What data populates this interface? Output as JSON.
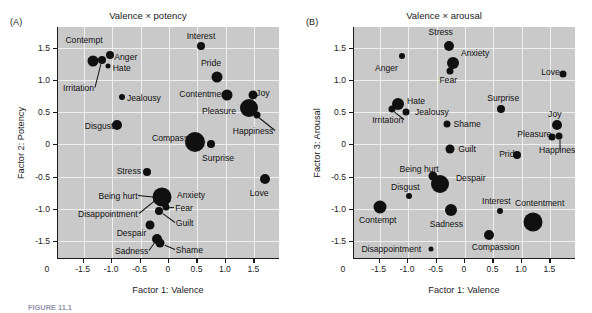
{
  "figure": {
    "caption": "FIGURE 11.1",
    "panels": [
      {
        "letter": "(A)",
        "title": "Valence × potency",
        "xlabel": "Factor 1: Valence",
        "ylabel": "Factor 2: Potency"
      },
      {
        "letter": "(B)",
        "title": "Valence × arousal",
        "xlabel": "Factor 1: Valence",
        "ylabel": "Factor 3: Arousal"
      }
    ]
  },
  "chart_data": [
    {
      "type": "scatter",
      "title": "Valence × potency",
      "xlabel": "Factor 1: Valence",
      "ylabel": "Factor 2: Potency",
      "xlim": [
        -1.95,
        1.95
      ],
      "ylim": [
        -1.78,
        1.82
      ],
      "xticks": [
        -1.5,
        -1.0,
        -0.5,
        0,
        0.5,
        1.0,
        1.5
      ],
      "xticklabels": [
        "-1.5",
        "-1.0",
        "-0.5",
        "0",
        "0.5",
        "1.0",
        "1.5"
      ],
      "yticks": [
        -1.5,
        -1.0,
        -0.5,
        0,
        0.5,
        1.0,
        1.5
      ],
      "yticklabels": [
        "-1.5",
        "-1.0",
        "-0.5",
        "0",
        "0.5",
        "1.0",
        "1.5"
      ],
      "origin_label": "0",
      "grid": true,
      "marker_color": "#101010",
      "points": [
        {
          "label": "Contempt",
          "x": -1.33,
          "y": 1.29,
          "size": 11,
          "lx": -1.82,
          "ly": 1.62,
          "anchor": "left",
          "leader": false
        },
        {
          "label": "Irritation",
          "x": -1.18,
          "y": 1.31,
          "size": 8,
          "lx": -1.86,
          "ly": 0.88,
          "anchor": "left",
          "leader": true
        },
        {
          "label": "Anger",
          "x": -1.04,
          "y": 1.39,
          "size": 8,
          "lx": -0.96,
          "ly": 1.36,
          "anchor": "left",
          "leader": false
        },
        {
          "label": "Hate",
          "x": -1.07,
          "y": 1.21,
          "size": 5,
          "lx": -0.99,
          "ly": 1.18,
          "anchor": "left",
          "leader": false
        },
        {
          "label": "Jealousy",
          "x": -0.82,
          "y": 0.73,
          "size": 6,
          "lx": -0.74,
          "ly": 0.72,
          "anchor": "left",
          "leader": false
        },
        {
          "label": "Disgust",
          "x": -0.92,
          "y": 0.3,
          "size": 10,
          "lx": -1.48,
          "ly": 0.28,
          "anchor": "left",
          "leader": false
        },
        {
          "label": "Compassion",
          "x": 0.45,
          "y": 0.03,
          "size": 20,
          "lx": -0.3,
          "ly": 0.09,
          "anchor": "left",
          "leader": false
        },
        {
          "label": "Surprise",
          "x": 0.74,
          "y": 0.01,
          "size": 8,
          "lx": 0.58,
          "ly": -0.22,
          "anchor": "left",
          "leader": false
        },
        {
          "label": "Interest",
          "x": 0.56,
          "y": 1.53,
          "size": 8,
          "lx": 0.31,
          "ly": 1.68,
          "anchor": "left",
          "leader": false
        },
        {
          "label": "Pride",
          "x": 0.85,
          "y": 1.05,
          "size": 11,
          "lx": 0.56,
          "ly": 1.26,
          "anchor": "left",
          "leader": false
        },
        {
          "label": "Contentment",
          "x": 1.02,
          "y": 0.76,
          "size": 11,
          "lx": 0.18,
          "ly": 0.78,
          "anchor": "left",
          "leader": false
        },
        {
          "label": "Pleasure",
          "x": 1.4,
          "y": 0.57,
          "size": 18,
          "lx": 0.58,
          "ly": 0.52,
          "anchor": "left",
          "leader": false
        },
        {
          "label": "Joy",
          "x": 1.48,
          "y": 0.77,
          "size": 9,
          "lx": 1.53,
          "ly": 0.8,
          "anchor": "left",
          "leader": false
        },
        {
          "label": "Happiness",
          "x": 1.54,
          "y": 0.45,
          "size": 7,
          "lx": 1.12,
          "ly": 0.21,
          "anchor": "left",
          "leader": true
        },
        {
          "label": "Love",
          "x": 1.68,
          "y": -0.54,
          "size": 10,
          "lx": 1.42,
          "ly": -0.76,
          "anchor": "left",
          "leader": false
        },
        {
          "label": "Stress",
          "x": -0.38,
          "y": -0.43,
          "size": 8,
          "lx": -0.92,
          "ly": -0.42,
          "anchor": "left",
          "leader": false
        },
        {
          "label": "Anxiety",
          "x": -0.12,
          "y": -0.82,
          "size": 19,
          "lx": 0.14,
          "ly": -0.78,
          "anchor": "left",
          "leader": false
        },
        {
          "label": "Being hurt",
          "x": -0.23,
          "y": -0.81,
          "size": 6,
          "lx": -1.24,
          "ly": -0.8,
          "anchor": "left",
          "leader": true
        },
        {
          "label": "Fear",
          "x": -0.06,
          "y": -0.98,
          "size": 7,
          "lx": 0.11,
          "ly": -0.99,
          "anchor": "left",
          "leader": true
        },
        {
          "label": "Disappointment",
          "x": -0.2,
          "y": -0.83,
          "size": 6,
          "lx": -1.6,
          "ly": -1.08,
          "anchor": "left",
          "leader": true
        },
        {
          "label": "Guilt",
          "x": -0.17,
          "y": -1.03,
          "size": 8,
          "lx": 0.12,
          "ly": -1.22,
          "anchor": "left",
          "leader": true
        },
        {
          "label": "Despair",
          "x": -0.34,
          "y": -1.25,
          "size": 9,
          "lx": -0.92,
          "ly": -1.38,
          "anchor": "left",
          "leader": false
        },
        {
          "label": "Sadness",
          "x": -0.21,
          "y": -1.47,
          "size": 10,
          "lx": -0.95,
          "ly": -1.66,
          "anchor": "left",
          "leader": true
        },
        {
          "label": "Shame",
          "x": -0.15,
          "y": -1.53,
          "size": 9,
          "lx": 0.12,
          "ly": -1.64,
          "anchor": "left",
          "leader": true
        }
      ]
    },
    {
      "type": "scatter",
      "title": "Valence × arousal",
      "xlabel": "Factor 1: Valence",
      "ylabel": "Factor 3: Arousal",
      "xlim": [
        -1.95,
        1.95
      ],
      "ylim": [
        -1.78,
        1.82
      ],
      "xticks": [
        -1.5,
        -1.0,
        -0.5,
        0,
        0.5,
        1.0,
        1.5
      ],
      "xticklabels": [
        "-1.5",
        "-1.0",
        "-0.5",
        "0",
        "0.5",
        "1.0",
        "1.5"
      ],
      "yticks": [
        -1.5,
        -1.0,
        -0.5,
        0,
        0.5,
        1.0,
        1.5
      ],
      "yticklabels": [
        "-1.5",
        "-1.0",
        "-0.5",
        "0",
        "0.5",
        "1.0",
        "1.5"
      ],
      "origin_label": "0",
      "grid": true,
      "marker_color": "#101010",
      "points": [
        {
          "label": "Stress",
          "x": -0.28,
          "y": 1.53,
          "size": 10,
          "lx": -0.64,
          "ly": 1.74,
          "anchor": "left",
          "leader": false
        },
        {
          "label": "Anger",
          "x": -1.1,
          "y": 1.37,
          "size": 6,
          "lx": -1.58,
          "ly": 1.18,
          "anchor": "left",
          "leader": false
        },
        {
          "label": "Anxiety",
          "x": -0.21,
          "y": 1.26,
          "size": 12,
          "lx": -0.07,
          "ly": 1.42,
          "anchor": "left",
          "leader": false
        },
        {
          "label": "Fear",
          "x": -0.26,
          "y": 1.13,
          "size": 7,
          "lx": -0.45,
          "ly": 0.99,
          "anchor": "left",
          "leader": false
        },
        {
          "label": "Love",
          "x": 1.73,
          "y": 1.09,
          "size": 7,
          "lx": 1.34,
          "ly": 1.12,
          "anchor": "left",
          "leader": false
        },
        {
          "label": "Hate",
          "x": -1.18,
          "y": 0.63,
          "size": 12,
          "lx": -1.02,
          "ly": 0.67,
          "anchor": "left",
          "leader": false
        },
        {
          "label": "Irritation",
          "x": -1.28,
          "y": 0.54,
          "size": 7,
          "lx": -1.63,
          "ly": 0.38,
          "anchor": "left",
          "leader": true
        },
        {
          "label": "Jealousy",
          "x": -1.03,
          "y": 0.5,
          "size": 7,
          "lx": -0.88,
          "ly": 0.5,
          "anchor": "left",
          "leader": false
        },
        {
          "label": "Surprise",
          "x": 0.63,
          "y": 0.55,
          "size": 8,
          "lx": 0.39,
          "ly": 0.72,
          "anchor": "left",
          "leader": false
        },
        {
          "label": "Shame",
          "x": -0.31,
          "y": 0.32,
          "size": 7,
          "lx": -0.2,
          "ly": 0.31,
          "anchor": "left",
          "leader": false
        },
        {
          "label": "Joy",
          "x": 1.62,
          "y": 0.3,
          "size": 10,
          "lx": 1.46,
          "ly": 0.47,
          "anchor": "left",
          "leader": false
        },
        {
          "label": "Pleasure",
          "x": 1.53,
          "y": 0.11,
          "size": 7,
          "lx": 0.92,
          "ly": 0.16,
          "anchor": "left",
          "leader": true
        },
        {
          "label": "Happiness",
          "x": 1.66,
          "y": 0.13,
          "size": 7,
          "lx": 1.3,
          "ly": -0.09,
          "anchor": "left",
          "leader": true
        },
        {
          "label": "Guilt",
          "x": -0.26,
          "y": -0.07,
          "size": 9,
          "lx": -0.12,
          "ly": -0.08,
          "anchor": "left",
          "leader": false
        },
        {
          "label": "Pride",
          "x": 0.92,
          "y": -0.16,
          "size": 8,
          "lx": 0.6,
          "ly": -0.15,
          "anchor": "left",
          "leader": false
        },
        {
          "label": "Being hurt",
          "x": -0.57,
          "y": -0.49,
          "size": 9,
          "lx": -1.15,
          "ly": -0.38,
          "anchor": "left",
          "leader": false
        },
        {
          "label": "Despair",
          "x": -0.44,
          "y": -0.62,
          "size": 18,
          "lx": -0.16,
          "ly": -0.53,
          "anchor": "left",
          "leader": false
        },
        {
          "label": "Disgust",
          "x": -0.98,
          "y": -0.81,
          "size": 6,
          "lx": -1.3,
          "ly": -0.67,
          "anchor": "left",
          "leader": false
        },
        {
          "label": "Contempt",
          "x": -1.5,
          "y": -0.98,
          "size": 13,
          "lx": -1.86,
          "ly": -1.18,
          "anchor": "left",
          "leader": false
        },
        {
          "label": "Sadness",
          "x": -0.25,
          "y": -1.02,
          "size": 12,
          "lx": -0.62,
          "ly": -1.24,
          "anchor": "left",
          "leader": false
        },
        {
          "label": "Interest",
          "x": 0.62,
          "y": -1.03,
          "size": 6,
          "lx": 0.3,
          "ly": -0.88,
          "anchor": "left",
          "leader": false
        },
        {
          "label": "Contentment",
          "x": 1.2,
          "y": -1.2,
          "size": 19,
          "lx": 0.88,
          "ly": -0.91,
          "anchor": "left",
          "leader": false
        },
        {
          "label": "Compassion",
          "x": 0.42,
          "y": -1.4,
          "size": 10,
          "lx": 0.12,
          "ly": -1.6,
          "anchor": "left",
          "leader": false
        },
        {
          "label": "Disappointment",
          "x": -0.6,
          "y": -1.63,
          "size": 5,
          "lx": -1.82,
          "ly": -1.62,
          "anchor": "left",
          "leader": false
        }
      ]
    }
  ]
}
